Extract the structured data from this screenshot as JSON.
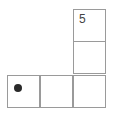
{
  "diagram": {
    "type": "L-shaped grid",
    "cells": [
      {
        "id": "top",
        "row": 0,
        "col": 2,
        "label": "5",
        "marker": null
      },
      {
        "id": "middle",
        "row": 1,
        "col": 2,
        "label": "",
        "marker": null
      },
      {
        "id": "bottom-left",
        "row": 2,
        "col": 0,
        "label": "",
        "marker": "dot"
      },
      {
        "id": "bottom-center",
        "row": 2,
        "col": 1,
        "label": "",
        "marker": null
      },
      {
        "id": "bottom-right",
        "row": 2,
        "col": 2,
        "label": "",
        "marker": null
      }
    ],
    "colors": {
      "line": "#9a9a9a",
      "dot": "#2a2a2a",
      "text": "#444444"
    }
  }
}
